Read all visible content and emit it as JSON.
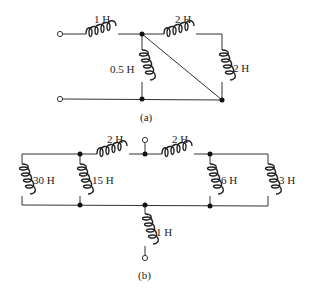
{
  "circuit_a": {
    "caption": "(a)",
    "inductors": [
      {
        "id": "L1",
        "label": "1 H"
      },
      {
        "id": "L2",
        "label": "0.5 H"
      },
      {
        "id": "L3",
        "label": "2 H"
      },
      {
        "id": "L4",
        "label": "2 H"
      }
    ]
  },
  "circuit_b": {
    "caption": "(b)",
    "inductors": [
      {
        "id": "L1",
        "label": "30 H"
      },
      {
        "id": "L2",
        "label": "15 H"
      },
      {
        "id": "L3",
        "label": "2 H"
      },
      {
        "id": "L4",
        "label": "2 H"
      },
      {
        "id": "L5",
        "label": "6 H"
      },
      {
        "id": "L6",
        "label": "3 H"
      },
      {
        "id": "L7",
        "label": "1 H"
      }
    ]
  }
}
